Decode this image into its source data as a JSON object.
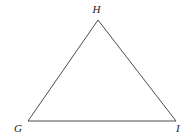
{
  "figure": {
    "name": "triangle-GHI",
    "background_color": "#ffffff",
    "stroke_color": "#4d4d4d",
    "stroke_width": 1,
    "label_color": "#1a1a1a",
    "vertices": [
      {
        "id": "H",
        "label": "H",
        "x": 98,
        "y": 20,
        "label_position": "above"
      },
      {
        "id": "G",
        "label": "G",
        "x": 28,
        "y": 121,
        "label_position": "below-left"
      },
      {
        "id": "I",
        "label": "I",
        "x": 176,
        "y": 121,
        "label_position": "below-right"
      }
    ],
    "edges": [
      {
        "id": "GH",
        "from": "G",
        "to": "H"
      },
      {
        "id": "HI",
        "from": "H",
        "to": "I"
      },
      {
        "id": "GI",
        "from": "G",
        "to": "I"
      }
    ],
    "polygon_points": "98,20 176,121 28,121"
  }
}
